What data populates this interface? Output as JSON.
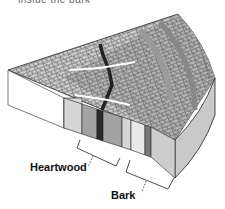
{
  "caption_cut": "inside the bark",
  "diagram": {
    "labels": {
      "heartwood": "Heartwood",
      "bark": "Bark"
    },
    "colors": {
      "outline": "#222222",
      "top_light": "#d9d9d9",
      "top_mid": "#a6a6a6",
      "dark_ring": "#2a2a2a",
      "face_white": "#ffffff",
      "face_light": "#d6d6d6",
      "face_mid": "#a3a3a3",
      "face_dark": "#2b2b2b",
      "face_bark": "#c8c8c8"
    }
  }
}
